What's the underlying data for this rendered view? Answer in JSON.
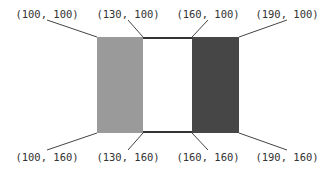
{
  "diagram": {
    "rects": [
      {
        "name": "gray-rect",
        "x": 97,
        "y": 37,
        "w": 46,
        "h": 96,
        "fill": "#9a9a9a"
      },
      {
        "name": "white-rect",
        "x": 143,
        "y": 37,
        "w": 49,
        "h": 96,
        "fill": "#ffffff",
        "border": "#333333"
      },
      {
        "name": "dark-rect",
        "x": 192,
        "y": 37,
        "w": 47,
        "h": 96,
        "fill": "#464646"
      }
    ],
    "labels": [
      {
        "id": "tl1",
        "text": "(100, 100)",
        "tx": 47,
        "ty": 18,
        "px": 97,
        "py": 37,
        "lx": 47,
        "ly": 20
      },
      {
        "id": "tl2",
        "text": "(130, 100)",
        "tx": 128,
        "ty": 18,
        "px": 143,
        "py": 37,
        "lx": 128,
        "ly": 20
      },
      {
        "id": "tl3",
        "text": "(160, 100)",
        "tx": 208,
        "ty": 18,
        "px": 192,
        "py": 37,
        "lx": 208,
        "ly": 20
      },
      {
        "id": "tl4",
        "text": "(190, 100)",
        "tx": 287,
        "ty": 18,
        "px": 239,
        "py": 37,
        "lx": 287,
        "ly": 20
      },
      {
        "id": "bl1",
        "text": "(100, 160)",
        "tx": 47,
        "ty": 161,
        "px": 97,
        "py": 133,
        "lx": 47,
        "ly": 150
      },
      {
        "id": "bl2",
        "text": "(130, 160)",
        "tx": 128,
        "ty": 161,
        "px": 143,
        "py": 133,
        "lx": 128,
        "ly": 150
      },
      {
        "id": "bl3",
        "text": "(160, 160)",
        "tx": 208,
        "ty": 161,
        "px": 192,
        "py": 133,
        "lx": 208,
        "ly": 150
      },
      {
        "id": "bl4",
        "text": "(190, 160)",
        "tx": 287,
        "ty": 161,
        "px": 239,
        "py": 133,
        "lx": 287,
        "ly": 150
      }
    ]
  }
}
